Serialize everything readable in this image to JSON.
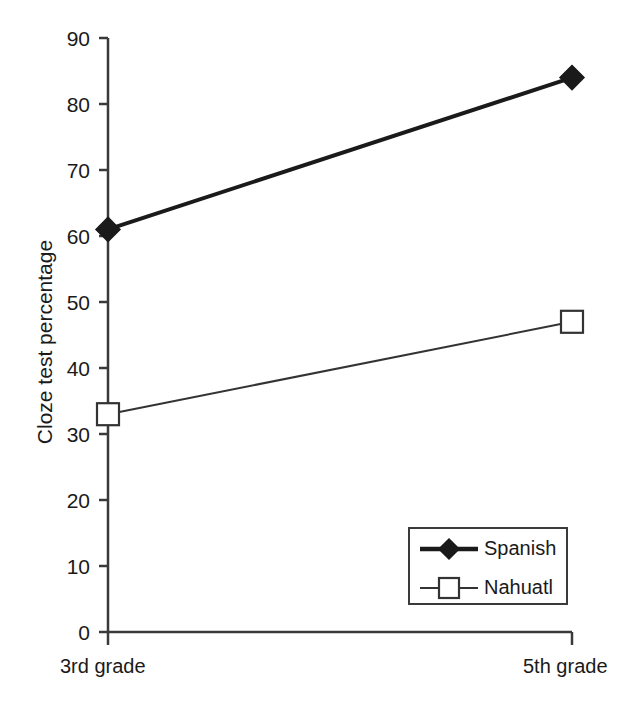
{
  "chart_data": {
    "type": "line",
    "title": "",
    "xlabel": "",
    "ylabel": "Cloze test percentage",
    "categories": [
      "3rd grade",
      "5th grade"
    ],
    "ylim": [
      0,
      90
    ],
    "ytick_step": 10,
    "yticks": [
      "90",
      "80",
      "70",
      "60",
      "50",
      "40",
      "30",
      "20",
      "10",
      "0"
    ],
    "grid": false,
    "legend_position": "inside bottom-right",
    "series": [
      {
        "name": "Spanish",
        "values": [
          61,
          84
        ],
        "marker": "filled-diamond",
        "color": "#1a1a1a",
        "line_width": 4
      },
      {
        "name": "Nahuatl",
        "values": [
          33,
          47
        ],
        "marker": "open-square",
        "color": "#333333",
        "line_width": 2
      }
    ]
  },
  "axis": {
    "y_label": "Cloze test percentage",
    "y_tick_labels": [
      "90",
      "80",
      "70",
      "60",
      "50",
      "40",
      "30",
      "20",
      "10",
      "0"
    ],
    "x_tick_labels": [
      "3rd grade",
      "5th grade"
    ]
  },
  "legend": {
    "entries": [
      {
        "label": "Spanish",
        "marker": "filled-diamond"
      },
      {
        "label": "Nahuatl",
        "marker": "open-square"
      }
    ]
  },
  "colors": {
    "axis": "#3a3a3a",
    "series_spanish": "#1a1a1a",
    "series_nahuatl": "#333333",
    "background": "#ffffff"
  }
}
